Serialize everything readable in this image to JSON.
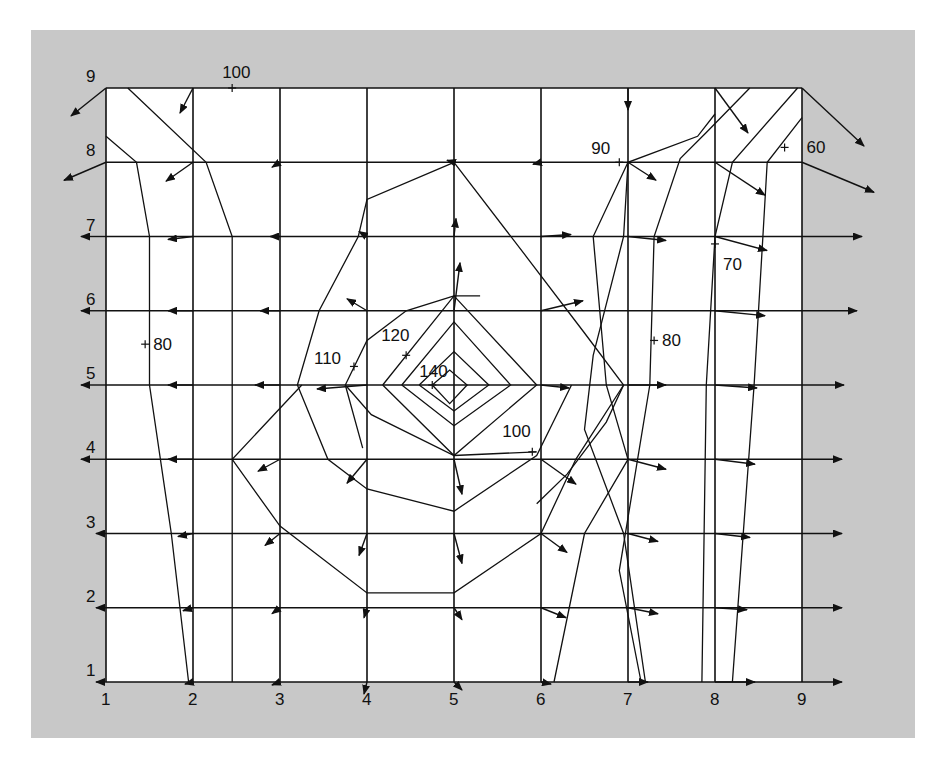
{
  "diagram": {
    "type": "contour-map-with-gradient-vectors",
    "colors": {
      "background": "#c8c8c8",
      "plot": "#ffffff",
      "ink": "#111111"
    },
    "grid": {
      "columns": [
        "1",
        "2",
        "3",
        "4",
        "5",
        "6",
        "7",
        "8",
        "9"
      ],
      "rows": [
        "1",
        "2",
        "3",
        "4",
        "5",
        "6",
        "7",
        "8",
        "9"
      ]
    },
    "contour_labels": [
      {
        "text": "100",
        "gx": 2.45,
        "gy": 9.0,
        "dx": -10,
        "dy": -10
      },
      {
        "text": "90",
        "gx": 6.9,
        "gy": 8.0,
        "dx": -28,
        "dy": -8
      },
      {
        "text": "60",
        "gx": 8.8,
        "gy": 8.2,
        "dx": 22,
        "dy": 6
      },
      {
        "text": "70",
        "gx": 8.0,
        "gy": 6.9,
        "dx": 8,
        "dy": 26
      },
      {
        "text": "80",
        "gx": 1.45,
        "gy": 5.55,
        "dx": 8,
        "dy": 6
      },
      {
        "text": "80",
        "gx": 7.3,
        "gy": 5.6,
        "dx": 8,
        "dy": 6
      },
      {
        "text": "110",
        "gx": 3.85,
        "gy": 5.25,
        "dx": -40,
        "dy": -2
      },
      {
        "text": "120",
        "gx": 4.45,
        "gy": 5.4,
        "dx": -25,
        "dy": -14
      },
      {
        "text": "140",
        "gx": 4.75,
        "gy": 5.0,
        "dx": -13,
        "dy": -8
      },
      {
        "text": "100",
        "gx": 5.9,
        "gy": 4.1,
        "dx": -30,
        "dy": -15
      }
    ],
    "contours": [
      {
        "level": "140",
        "points": [
          [
            4.75,
            5
          ],
          [
            4.95,
            5.2
          ],
          [
            5.15,
            5
          ],
          [
            4.95,
            4.75
          ],
          [
            4.75,
            5
          ]
        ]
      },
      {
        "level": "130",
        "points": [
          [
            4.4,
            5
          ],
          [
            5,
            5.85
          ],
          [
            5.65,
            5
          ],
          [
            5,
            4.45
          ],
          [
            4.4,
            5
          ]
        ]
      },
      {
        "level": "125",
        "points": [
          [
            4.6,
            5
          ],
          [
            5,
            5.45
          ],
          [
            5.4,
            5
          ],
          [
            5,
            4.65
          ],
          [
            4.6,
            5
          ]
        ]
      },
      {
        "level": "120",
        "points": [
          [
            4.18,
            5
          ],
          [
            5,
            6.2
          ],
          [
            5.95,
            5
          ],
          [
            5,
            4.05
          ],
          [
            4.18,
            5
          ]
        ]
      },
      {
        "level": "110",
        "points": [
          [
            3.95,
            4.15
          ],
          [
            3.75,
            5
          ],
          [
            4,
            5.6
          ],
          [
            4.45,
            6.0
          ],
          [
            5,
            6.2
          ],
          [
            5.3,
            6.2
          ]
        ]
      },
      {
        "level": "110b",
        "points": [
          [
            3.75,
            5
          ],
          [
            4.05,
            4.6
          ],
          [
            5,
            4.05
          ],
          [
            5.95,
            4.1
          ]
        ]
      },
      {
        "level": "100",
        "points": [
          [
            5,
            8.0
          ],
          [
            4,
            7.5
          ],
          [
            3.9,
            7.0
          ],
          [
            3.45,
            6.0
          ],
          [
            3.2,
            5.0
          ],
          [
            3.55,
            4.0
          ],
          [
            4,
            3.6
          ],
          [
            5,
            3.3
          ],
          [
            5.95,
            4.05
          ],
          [
            6.35,
            5.0
          ]
        ]
      },
      {
        "level": "100-right",
        "points": [
          [
            5,
            8.0
          ],
          [
            5.85,
            6.7
          ],
          [
            6.5,
            5.7
          ],
          [
            6.95,
            5.0
          ],
          [
            6.75,
            4.5
          ],
          [
            6.3,
            3.8
          ],
          [
            5.95,
            3.4
          ]
        ]
      },
      {
        "level": "100-bottom",
        "points": [
          [
            3.25,
            5
          ],
          [
            2.45,
            4
          ],
          [
            3.0,
            3.1
          ],
          [
            4.0,
            2.2
          ],
          [
            5.0,
            2.2
          ],
          [
            6.0,
            3.0
          ],
          [
            6.4,
            4.0
          ],
          [
            6.95,
            5.0
          ]
        ]
      },
      {
        "level": "90a",
        "points": [
          [
            1.25,
            9
          ],
          [
            2.15,
            8.0
          ],
          [
            2.45,
            7.0
          ],
          [
            2.45,
            1.0
          ]
        ]
      },
      {
        "level": "90-top",
        "points": [
          [
            1.0,
            8.35
          ],
          [
            1.35,
            8.0
          ],
          [
            1.5,
            7.0
          ],
          [
            1.5,
            5.0
          ],
          [
            1.75,
            3
          ],
          [
            1.95,
            1.0
          ]
        ]
      },
      {
        "level": "90-right",
        "points": [
          [
            7,
            8
          ],
          [
            6.6,
            7
          ],
          [
            6.75,
            5
          ],
          [
            7.0,
            4.0
          ],
          [
            6.5,
            3.0
          ],
          [
            6.15,
            1.0
          ]
        ]
      },
      {
        "level": "80-right",
        "points": [
          [
            8,
            8.65
          ],
          [
            7.8,
            8.35
          ],
          [
            7,
            8
          ],
          [
            6.95,
            7.0
          ],
          [
            6.6,
            5.4
          ],
          [
            6.5,
            4.4
          ],
          [
            6.95,
            3.0
          ],
          [
            7.2,
            1.0
          ]
        ]
      },
      {
        "level": "80-right2",
        "points": [
          [
            8.4,
            9
          ],
          [
            7.9,
            8.4
          ],
          [
            7.6,
            8.05
          ],
          [
            7.3,
            7.0
          ],
          [
            7.25,
            5.0
          ],
          [
            6.9,
            2.5
          ],
          [
            7.15,
            1.0
          ]
        ]
      },
      {
        "level": "70",
        "points": [
          [
            8.95,
            9
          ],
          [
            8.2,
            8.0
          ],
          [
            8.0,
            7.0
          ],
          [
            7.9,
            5.0
          ],
          [
            7.85,
            1.0
          ]
        ]
      },
      {
        "level": "60",
        "points": [
          [
            9,
            8.6
          ],
          [
            8.6,
            8.0
          ],
          [
            8.55,
            7.0
          ],
          [
            8.45,
            5.0
          ],
          [
            8.2,
            1.0
          ]
        ]
      }
    ],
    "arrows": [
      {
        "gx": 1,
        "gy": 9,
        "ddx": -35,
        "ddy": 28
      },
      {
        "gx": 1,
        "gy": 8,
        "ddx": -42,
        "ddy": 18
      },
      {
        "gx": 2,
        "gy": 9,
        "ddx": -13,
        "ddy": 25
      },
      {
        "gx": 2,
        "gy": 8,
        "ddx": -27,
        "ddy": 19
      },
      {
        "gx": 3,
        "gy": 8,
        "ddx": -8,
        "ddy": 5
      },
      {
        "gx": 9,
        "gy": 9,
        "ddx": 62,
        "ddy": 58
      },
      {
        "gx": 9,
        "gy": 8,
        "ddx": 72,
        "ddy": 30
      },
      {
        "gx": 8,
        "gy": 9,
        "ddx": 33,
        "ddy": 45
      },
      {
        "gx": 8,
        "gy": 8,
        "ddx": 50,
        "ddy": 33
      },
      {
        "gx": 7,
        "gy": 9,
        "ddx": 0,
        "ddy": 22
      },
      {
        "gx": 7,
        "gy": 8,
        "ddx": 28,
        "ddy": 18
      },
      {
        "gx": 8,
        "gy": 7,
        "ddx": 52,
        "ddy": 14
      },
      {
        "gx": 8,
        "gy": 6,
        "ddx": 50,
        "ddy": 5
      },
      {
        "gx": 7,
        "gy": 7,
        "ddx": 38,
        "ddy": 4
      },
      {
        "gx": 6,
        "gy": 7,
        "ddx": 30,
        "ddy": -2
      },
      {
        "gx": 6,
        "gy": 6,
        "ddx": 42,
        "ddy": -10
      },
      {
        "gx": 1,
        "gy": 7,
        "ddx": -25,
        "ddy": 0
      },
      {
        "gx": 2,
        "gy": 7,
        "ddx": -25,
        "ddy": 3
      },
      {
        "gx": 3,
        "gy": 7,
        "ddx": -10,
        "ddy": 0
      },
      {
        "gx": 1,
        "gy": 6,
        "ddx": -25,
        "ddy": 0
      },
      {
        "gx": 2,
        "gy": 6,
        "ddx": -25,
        "ddy": 0
      },
      {
        "gx": 3,
        "gy": 6,
        "ddx": -20,
        "ddy": 0
      },
      {
        "gx": 4,
        "gy": 6,
        "ddx": -20,
        "ddy": -12
      },
      {
        "gx": 4,
        "gy": 7,
        "ddx": -8,
        "ddy": -5
      },
      {
        "gx": 5,
        "gy": 7,
        "ddx": 2,
        "ddy": -18
      },
      {
        "gx": 5,
        "gy": 6,
        "ddx": 6,
        "ddy": -48
      },
      {
        "gx": 1,
        "gy": 5,
        "ddx": -25,
        "ddy": 0
      },
      {
        "gx": 2,
        "gy": 5,
        "ddx": -25,
        "ddy": 0
      },
      {
        "gx": 3,
        "gy": 5,
        "ddx": -25,
        "ddy": 0
      },
      {
        "gx": 4,
        "gy": 5,
        "ddx": -50,
        "ddy": 4
      },
      {
        "gx": 6,
        "gy": 5,
        "ddx": 28,
        "ddy": 3
      },
      {
        "gx": 7,
        "gy": 5,
        "ddx": 38,
        "ddy": 0
      },
      {
        "gx": 8,
        "gy": 5,
        "ddx": 42,
        "ddy": 3
      },
      {
        "gx": 1,
        "gy": 4,
        "ddx": -25,
        "ddy": 0
      },
      {
        "gx": 2,
        "gy": 4,
        "ddx": -25,
        "ddy": 0
      },
      {
        "gx": 3,
        "gy": 4,
        "ddx": -22,
        "ddy": 12
      },
      {
        "gx": 4,
        "gy": 4,
        "ddx": -20,
        "ddy": 24
      },
      {
        "gx": 5,
        "gy": 4,
        "ddx": 8,
        "ddy": 35
      },
      {
        "gx": 6,
        "gy": 4,
        "ddx": 35,
        "ddy": 25
      },
      {
        "gx": 7,
        "gy": 4,
        "ddx": 38,
        "ddy": 10
      },
      {
        "gx": 8,
        "gy": 4,
        "ddx": 40,
        "ddy": 5
      },
      {
        "gx": 2,
        "gy": 3,
        "ddx": -15,
        "ddy": 3
      },
      {
        "gx": 3,
        "gy": 3,
        "ddx": -15,
        "ddy": 12
      },
      {
        "gx": 4,
        "gy": 3,
        "ddx": -8,
        "ddy": 22
      },
      {
        "gx": 5,
        "gy": 3,
        "ddx": 8,
        "ddy": 30
      },
      {
        "gx": 6,
        "gy": 3,
        "ddx": 26,
        "ddy": 19
      },
      {
        "gx": 7,
        "gy": 3,
        "ddx": 30,
        "ddy": 8
      },
      {
        "gx": 8,
        "gy": 3,
        "ddx": 35,
        "ddy": 4
      },
      {
        "gx": 2,
        "gy": 2,
        "ddx": -10,
        "ddy": 3
      },
      {
        "gx": 3,
        "gy": 2,
        "ddx": -8,
        "ddy": 6
      },
      {
        "gx": 4,
        "gy": 2,
        "ddx": -3,
        "ddy": 10
      },
      {
        "gx": 5,
        "gy": 2,
        "ddx": 8,
        "ddy": 12
      },
      {
        "gx": 6,
        "gy": 2,
        "ddx": 25,
        "ddy": 10
      },
      {
        "gx": 7,
        "gy": 2,
        "ddx": 30,
        "ddy": 6
      },
      {
        "gx": 8,
        "gy": 2,
        "ddx": 32,
        "ddy": 2
      },
      {
        "gx": 1,
        "gy": 1,
        "ddx": -10,
        "ddy": 0
      },
      {
        "gx": 2,
        "gy": 1,
        "ddx": -8,
        "ddy": 2
      },
      {
        "gx": 3,
        "gy": 1,
        "ddx": -8,
        "ddy": 3
      },
      {
        "gx": 4,
        "gy": 1,
        "ddx": -3,
        "ddy": 12
      },
      {
        "gx": 5,
        "gy": 1,
        "ddx": 8,
        "ddy": 8
      },
      {
        "gx": 6,
        "gy": 1,
        "ddx": 10,
        "ddy": 2
      },
      {
        "gx": 7,
        "gy": 1,
        "ddx": 20,
        "ddy": 0
      },
      {
        "gx": 8,
        "gy": 1,
        "ddx": 40,
        "ddy": 0
      },
      {
        "gx": 9,
        "gy": 1,
        "ddx": 40,
        "ddy": 0
      },
      {
        "gx": 9,
        "gy": 2,
        "ddx": 40,
        "ddy": 0
      },
      {
        "gx": 9,
        "gy": 3,
        "ddx": 40,
        "ddy": 0
      },
      {
        "gx": 9,
        "gy": 4,
        "ddx": 40,
        "ddy": 0
      },
      {
        "gx": 9,
        "gy": 5,
        "ddx": 42,
        "ddy": 0
      },
      {
        "gx": 9,
        "gy": 6,
        "ddx": 55,
        "ddy": 0
      },
      {
        "gx": 9,
        "gy": 7,
        "ddx": 60,
        "ddy": 0
      },
      {
        "gx": 1,
        "gy": 3,
        "ddx": -10,
        "ddy": 0
      },
      {
        "gx": 1,
        "gy": 2,
        "ddx": -10,
        "ddy": 0
      },
      {
        "gx": 5,
        "gy": 8,
        "ddx": -7,
        "ddy": -2
      },
      {
        "gx": 6,
        "gy": 8,
        "ddx": -8,
        "ddy": 2
      }
    ]
  }
}
